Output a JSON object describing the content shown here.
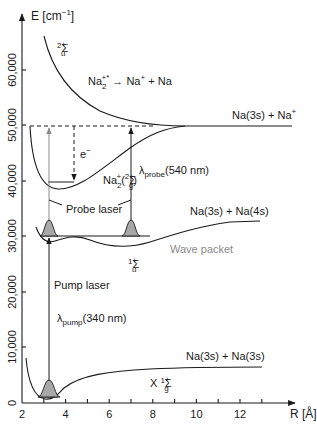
{
  "diagram": {
    "y_axis": {
      "label": "E [cm⁻¹]",
      "ticks": [
        "0",
        "10,000",
        "20,000",
        "30,000",
        "40,000",
        "50,000",
        "60,000"
      ]
    },
    "x_axis": {
      "label": "R [Å]",
      "ticks": [
        "2",
        "4",
        "6",
        "8",
        "10",
        "12"
      ]
    },
    "states": {
      "repulsive": "²Σᵤ⁺",
      "dissociation": "Na₂⁺* → Na⁺ + Na",
      "ion_asymptote": "Na(3s) + Na⁺",
      "ion_state": "Na₂⁺(²Σg⁺)",
      "excited_asymptote": "Na(3s) + Na(4s)",
      "excited_state": "¹Σᵤ⁺",
      "ground_asymptote": "Na(3s) + Na(3s)",
      "ground_state": "X ¹Σg⁺"
    },
    "annotations": {
      "electron": "e⁻",
      "probe_laser": "Probe laser",
      "probe_wavelength": "λprobe(540 nm)",
      "pump_laser": "Pump laser",
      "pump_wavelength": "λpump(340 nm)",
      "wave_packet": "Wave packet"
    },
    "labels": {
      "E": "E",
      "E_unit": "[cm",
      "E_exp": "−1",
      "E_close": "]",
      "R": "R [Å]",
      "sigma": "Σ",
      "sup2": "2",
      "sup1": "1",
      "plus": "+",
      "u": "u",
      "g": "g",
      "Na": "Na",
      "two": "2",
      "plus_star": "+*",
      "arrow_text": " → Na",
      "plus_na": " + Na",
      "na3s_na": "Na(3s) + Na",
      "na3s_na4s": "Na(3s) + Na(4s)",
      "na3s_na3s": "Na(3s) + Na(3s)",
      "open_paren": "(",
      "close_paren": ")",
      "X": "X ",
      "e": "e",
      "minus": "−",
      "lambda": "λ",
      "probe_sub": "probe",
      "pump_sub": "pump",
      "probe_nm": "(540 nm)",
      "pump_nm": "(340 nm)",
      "probe_laser": "Probe laser",
      "pump_laser": "Pump laser",
      "wave_packet": "Wave packet"
    }
  }
}
